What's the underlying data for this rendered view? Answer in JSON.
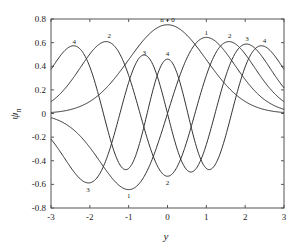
{
  "chart_data": {
    "type": "line",
    "title": "",
    "xlabel": "y",
    "ylabel": "ψ",
    "ylabel_subscript": "n",
    "xlim": [
      -3,
      3
    ],
    "ylim": [
      -0.8,
      0.8
    ],
    "xticks": [
      -3,
      -2,
      -1,
      0,
      1,
      2,
      3
    ],
    "xtick_labels": [
      "-3",
      "-2",
      "-1",
      "0",
      "1",
      "2",
      "3"
    ],
    "yticks": [
      -0.8,
      -0.6,
      -0.4,
      -0.2,
      0,
      0.2,
      0.4,
      0.6,
      0.8
    ],
    "ytick_labels": [
      "-0.8",
      "-0.6",
      "-0.4",
      "-0.2",
      "0",
      "0.2",
      "0.4",
      "0.6",
      "0.8"
    ],
    "grid": false,
    "line_color": "#333333",
    "x": [
      -3,
      -2.5,
      -2,
      -1.5,
      -1,
      -0.5,
      0,
      0.5,
      1,
      1.5,
      2,
      2.5,
      3
    ],
    "series": [
      {
        "name": "n = 0",
        "n": 0,
        "values": [
          0.008,
          0.033,
          0.102,
          0.244,
          0.456,
          0.663,
          0.751,
          0.663,
          0.456,
          0.244,
          0.102,
          0.033,
          0.008
        ]
      },
      {
        "name": "1",
        "n": 1,
        "values": [
          -0.034,
          -0.117,
          -0.288,
          -0.517,
          -0.644,
          -0.469,
          0,
          0.469,
          0.644,
          0.517,
          0.288,
          0.117,
          0.034
        ]
      },
      {
        "name": "2",
        "n": 2,
        "values": [
          0.099,
          0.269,
          0.511,
          0.609,
          0.322,
          -0.234,
          -0.531,
          -0.234,
          0.322,
          0.609,
          0.511,
          0.269,
          0.099
        ]
      },
      {
        "name": "3",
        "n": 3,
        "values": [
          -0.236,
          -0.502,
          -0.591,
          -0.149,
          0.372,
          0.469,
          0,
          -0.469,
          -0.372,
          0.149,
          0.591,
          0.502,
          0.236
        ]
      },
      {
        "name": "4",
        "n": 4,
        "values": [
          0.446,
          0.601,
          0.238,
          -0.431,
          -0.186,
          0.406,
          0.46,
          0.406,
          -0.186,
          -0.431,
          0.238,
          0.601,
          0.446
        ]
      }
    ],
    "annotations": [
      {
        "text": "n = 0",
        "x": 0,
        "y": 0.75
      },
      {
        "text": "1",
        "x": 1,
        "y": 0.64
      },
      {
        "text": "1",
        "x": -1,
        "y": -0.64
      },
      {
        "text": "2",
        "x": -1.5,
        "y": 0.61
      },
      {
        "text": "2",
        "x": 1.6,
        "y": 0.61
      },
      {
        "text": "2",
        "x": 0,
        "y": -0.53
      },
      {
        "text": "3",
        "x": -0.6,
        "y": 0.47
      },
      {
        "text": "3",
        "x": 2.05,
        "y": 0.59
      },
      {
        "text": "3",
        "x": -2.05,
        "y": -0.59
      },
      {
        "text": "4",
        "x": -2.4,
        "y": 0.56
      },
      {
        "text": "4",
        "x": 0,
        "y": 0.46
      },
      {
        "text": "4",
        "x": 2.5,
        "y": 0.57
      }
    ]
  }
}
